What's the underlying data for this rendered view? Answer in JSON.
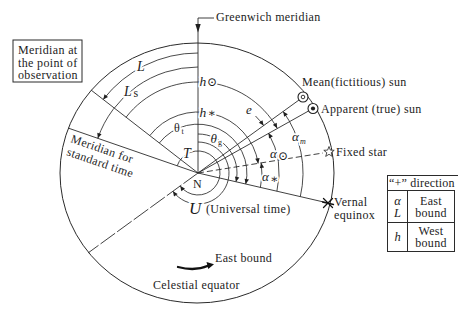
{
  "figure": {
    "greenwich_meridian": "Greenwich meridian",
    "observation_meridian_box": [
      "Meridian at",
      "the point of",
      "observation"
    ],
    "standard_time_meridian": [
      "Meridian for",
      "standard time"
    ],
    "mean_sun": "Mean(fictitious) sun",
    "apparent_sun": "Apparent (true) sun",
    "fixed_star": "Fixed star",
    "vernal_equinox": [
      "Vernal",
      "equinox"
    ],
    "center": "N",
    "universal_time": {
      "symbol": "U",
      "label": "(Universal time)"
    },
    "east_bound": "East bound",
    "celestial_equator": "Celestial equator",
    "arcs": {
      "longitude": {
        "symbol": "L"
      },
      "longitude_standard": {
        "symbol": "L",
        "sub": "s"
      },
      "hour_angle_sun": {
        "symbol": "h",
        "mark": "⊙"
      },
      "hour_angle_star": {
        "symbol": "h",
        "mark": "∗"
      },
      "local_sidereal_time": {
        "symbol": "θ",
        "sub": "t"
      },
      "greenwich_sidereal_time": {
        "symbol": "θ",
        "sub": "g"
      },
      "standard_time": {
        "symbol": "T"
      },
      "equation_of_time": {
        "symbol": "e"
      },
      "ra_mean_sun": {
        "symbol": "α",
        "sub": "m"
      },
      "ra_apparent_sun": {
        "symbol": "α",
        "sub": "⊙"
      },
      "ra_star": {
        "symbol": "α",
        "sub": "∗"
      }
    },
    "icons": {
      "mean_sun": "mean-sun-icon",
      "apparent_sun": "apparent-sun-icon",
      "fixed_star": "star-outline-icon",
      "vernal_equinox": "asterisk-cross-icon",
      "east_bound_arrow": "curved-arrow-right-icon",
      "greenwich_pointer": "arrow-down-icon"
    }
  },
  "sign_convention_table": {
    "header": "“+” direction",
    "rows": [
      {
        "symbols": [
          "α",
          "L"
        ],
        "direction": [
          "East",
          "bound"
        ]
      },
      {
        "symbols": [
          "h"
        ],
        "direction": [
          "West",
          "bound"
        ]
      }
    ]
  }
}
